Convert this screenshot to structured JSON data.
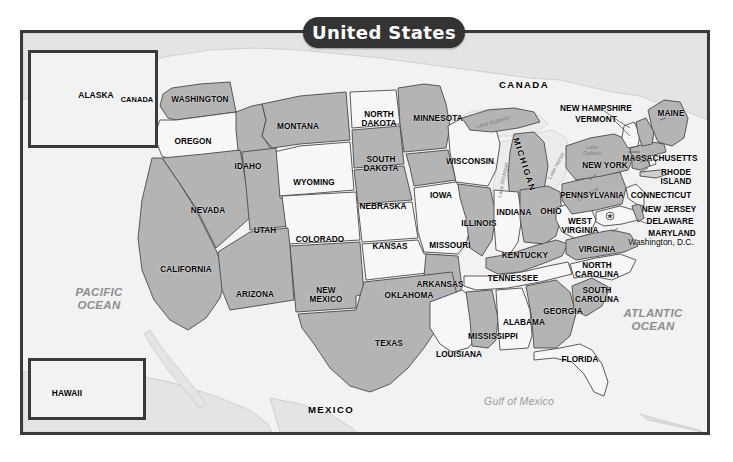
{
  "title": "United States",
  "frame": {
    "outer_border_color": "#3a3a3a",
    "land_gray": "#b4b4b4",
    "land_white": "#f7f7f7",
    "background": "#f2f2f2"
  },
  "insets": [
    {
      "name": "alaska",
      "labels": [
        {
          "text": "ALASKA"
        },
        {
          "text": "CANADA"
        }
      ]
    },
    {
      "name": "hawaii",
      "labels": [
        {
          "text": "HAWAII"
        }
      ]
    }
  ],
  "countries": [
    {
      "name": "canada",
      "label": "CANADA"
    },
    {
      "name": "mexico",
      "label": "MEXICO"
    }
  ],
  "water": [
    {
      "name": "pacific-ocean",
      "label": "PACIFIC\nOCEAN"
    },
    {
      "name": "atlantic-ocean",
      "label": "ATLANTIC\nOCEAN"
    },
    {
      "name": "gulf-of-mexico",
      "label": "Gulf of Mexico"
    }
  ],
  "lakes": [
    {
      "name": "lake-superior",
      "label": "Lake Superior"
    },
    {
      "name": "lake-michigan",
      "label": "Lake Michigan"
    },
    {
      "name": "lake-huron",
      "label": "Lake Huron"
    },
    {
      "name": "lake-erie",
      "label": "Lake Erie"
    },
    {
      "name": "lake-ontario",
      "label": "Lake\nOntario"
    }
  ],
  "capital": {
    "label": "Washington, D.C.",
    "marker": "star-icon"
  },
  "states": [
    {
      "label": "WASHINGTON"
    },
    {
      "label": "OREGON"
    },
    {
      "label": "IDAHO"
    },
    {
      "label": "MONTANA"
    },
    {
      "label": "WYOMING"
    },
    {
      "label": "NEVADA"
    },
    {
      "label": "UTAH"
    },
    {
      "label": "COLORADO"
    },
    {
      "label": "CALIFORNIA"
    },
    {
      "label": "ARIZONA"
    },
    {
      "label": "NEW\nMEXICO"
    },
    {
      "label": "NORTH\nDAKOTA"
    },
    {
      "label": "SOUTH\nDAKOTA"
    },
    {
      "label": "NEBRASKA"
    },
    {
      "label": "KANSAS"
    },
    {
      "label": "OKLAHOMA"
    },
    {
      "label": "TEXAS"
    },
    {
      "label": "MINNESOTA"
    },
    {
      "label": "IOWA"
    },
    {
      "label": "MISSOURI"
    },
    {
      "label": "ARKANSAS"
    },
    {
      "label": "LOUISIANA"
    },
    {
      "label": "WISCONSIN"
    },
    {
      "label": "ILLINOIS"
    },
    {
      "label": "MICHIGAN"
    },
    {
      "label": "INDIANA"
    },
    {
      "label": "OHIO"
    },
    {
      "label": "KENTUCKY"
    },
    {
      "label": "TENNESSEE"
    },
    {
      "label": "MISSISSIPPI"
    },
    {
      "label": "ALABAMA"
    },
    {
      "label": "GEORGIA"
    },
    {
      "label": "FLORIDA"
    },
    {
      "label": "SOUTH\nCAROLINA"
    },
    {
      "label": "NORTH\nCAROLINA"
    },
    {
      "label": "VIRGINIA"
    },
    {
      "label": "WEST\nVIRGINIA"
    },
    {
      "label": "MARYLAND"
    },
    {
      "label": "DELAWARE"
    },
    {
      "label": "NEW JERSEY"
    },
    {
      "label": "PENNSYLVANIA"
    },
    {
      "label": "NEW YORK"
    },
    {
      "label": "CONNECTICUT"
    },
    {
      "label": "RHODE\nISLAND"
    },
    {
      "label": "MASSACHUSETTS"
    },
    {
      "label": "VERMONT"
    },
    {
      "label": "NEW HAMPSHIRE"
    },
    {
      "label": "MAINE"
    }
  ],
  "labels": {
    "washington": "WASHINGTON",
    "oregon": "OREGON",
    "idaho": "IDAHO",
    "montana": "MONTANA",
    "wyoming": "WYOMING",
    "nevada": "NEVADA",
    "utah": "UTAH",
    "colorado": "COLORADO",
    "california": "CALIFORNIA",
    "arizona": "ARIZONA",
    "new_mexico": "NEW\nMEXICO",
    "north_dakota": "NORTH\nDAKOTA",
    "south_dakota": "SOUTH\nDAKOTA",
    "nebraska": "NEBRASKA",
    "kansas": "KANSAS",
    "oklahoma": "OKLAHOMA",
    "texas": "TEXAS",
    "minnesota": "MINNESOTA",
    "iowa": "IOWA",
    "missouri": "MISSOURI",
    "arkansas": "ARKANSAS",
    "louisiana": "LOUISIANA",
    "wisconsin": "WISCONSIN",
    "illinois": "ILLINOIS",
    "michigan": "MICHIGAN",
    "indiana": "INDIANA",
    "ohio": "OHIO",
    "kentucky": "KENTUCKY",
    "tennessee": "TENNESSEE",
    "mississippi": "MISSISSIPPI",
    "alabama": "ALABAMA",
    "georgia": "GEORGIA",
    "florida": "FLORIDA",
    "south_carolina": "SOUTH\nCAROLINA",
    "north_carolina": "NORTH\nCAROLINA",
    "virginia": "VIRGINIA",
    "west_virginia": "WEST\nVIRGINIA",
    "maryland": "MARYLAND",
    "delaware": "DELAWARE",
    "new_jersey": "NEW JERSEY",
    "pennsylvania": "PENNSYLVANIA",
    "new_york": "NEW YORK",
    "connecticut": "CONNECTICUT",
    "rhode_island": "RHODE\nISLAND",
    "massachusetts": "MASSACHUSETTS",
    "vermont": "VERMONT",
    "new_hampshire": "NEW HAMPSHIRE",
    "maine": "MAINE",
    "alaska": "ALASKA",
    "hawaii": "HAWAII",
    "canada": "CANADA",
    "canada_inset": "CANADA",
    "mexico": "MEXICO",
    "pacific_ocean": "PACIFIC\nOCEAN",
    "atlantic_ocean": "ATLANTIC\nOCEAN",
    "gulf_of_mexico": "Gulf of Mexico",
    "lake_superior": "Lake Superior",
    "lake_michigan": "Lake Michigan",
    "lake_huron": "Lake Huron",
    "lake_erie": "Lake Erie",
    "lake_ontario": "Lake\nOntario",
    "washington_dc": "Washington, D.C."
  }
}
